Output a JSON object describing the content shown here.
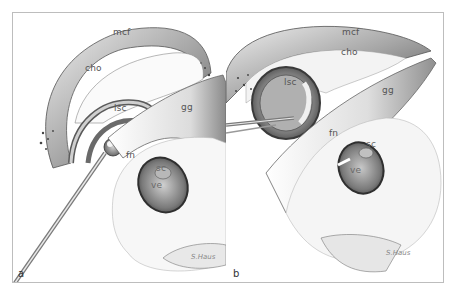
{
  "figure": {
    "panels": [
      {
        "id": "a",
        "letter": "a",
        "labels": {
          "mcf": "mcf",
          "cho": "cho",
          "lsc": "lsc",
          "gg": "gg",
          "fn": "fn",
          "sc": "sc",
          "ve": "ve"
        },
        "signature": "S.Haus"
      },
      {
        "id": "b",
        "letter": "b",
        "labels": {
          "mcf": "mcf",
          "cho": "cho",
          "lsc": "lsc",
          "gg": "gg",
          "fn": "fn",
          "sc": "sc",
          "ve": "ve"
        },
        "signature": "S.Haus"
      }
    ],
    "colors": {
      "frame": "#bdbdbd",
      "tissue_dark": "#4a4a4a",
      "tissue_mid": "#9a9a9a",
      "tissue_light": "#e6e6e6",
      "background": "#ffffff"
    }
  }
}
